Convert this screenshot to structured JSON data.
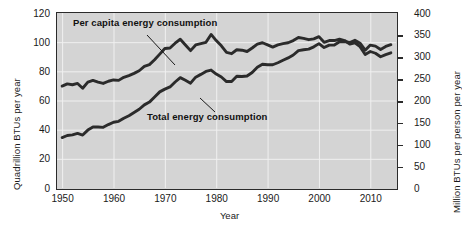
{
  "chart_data": {
    "type": "line",
    "title": "",
    "xlabel": "Year",
    "ylabel": "Quadrillion BTUs per year",
    "ylabel_right": "Million BTUs per person per year",
    "xlim": [
      1949,
      2015
    ],
    "ylim": [
      0,
      120
    ],
    "ylim_right": [
      0,
      400
    ],
    "xticks": [
      1950,
      1960,
      1970,
      1980,
      1990,
      2000,
      2010
    ],
    "xtick_labels": [
      "1950",
      "1960",
      "1970",
      "1980",
      "1990",
      "2000",
      "2010"
    ],
    "yticks_left": [
      0,
      20,
      40,
      60,
      80,
      100,
      120
    ],
    "ytick_labels_left": [
      "0",
      "20",
      "40",
      "60",
      "80",
      "100",
      "120"
    ],
    "yticks_right": [
      0,
      50,
      100,
      150,
      200,
      250,
      300,
      350,
      400
    ],
    "ytick_labels_right": [
      "0",
      "50",
      "100",
      "150",
      "200",
      "250",
      "300",
      "350",
      "400"
    ],
    "grid": true,
    "grid_color": "#f0f0f0",
    "plot_background": "#d4d4d4",
    "line_color": "#2b2b2b",
    "legend_position": "inline-annotations",
    "series": [
      {
        "name": "Per capita energy consumption",
        "axis": "right",
        "units": "Million BTUs per person per year",
        "x": [
          1950,
          1951,
          1952,
          1953,
          1954,
          1955,
          1956,
          1957,
          1958,
          1959,
          1960,
          1961,
          1962,
          1963,
          1964,
          1965,
          1966,
          1967,
          1968,
          1969,
          1970,
          1971,
          1972,
          1973,
          1974,
          1975,
          1976,
          1977,
          1978,
          1979,
          1980,
          1981,
          1982,
          1983,
          1984,
          1985,
          1986,
          1987,
          1988,
          1989,
          1990,
          1991,
          1992,
          1993,
          1994,
          1995,
          1996,
          1997,
          1998,
          1999,
          2000,
          2001,
          2002,
          2003,
          2004,
          2005,
          2006,
          2007,
          2008,
          2009,
          2010,
          2011,
          2012,
          2013,
          2014
        ],
        "values": [
          233,
          238,
          236,
          239,
          228,
          242,
          246,
          242,
          239,
          244,
          247,
          246,
          253,
          257,
          262,
          268,
          278,
          282,
          293,
          306,
          319,
          320,
          331,
          340,
          327,
          314,
          327,
          330,
          333,
          351,
          337,
          325,
          310,
          307,
          316,
          315,
          312,
          320,
          329,
          332,
          327,
          322,
          327,
          330,
          332,
          337,
          344,
          342,
          339,
          341,
          346,
          333,
          337,
          337,
          340,
          337,
          329,
          332,
          323,
          305,
          312,
          308,
          300,
          305,
          309
        ],
        "label_text": "Per capita energy consumption"
      },
      {
        "name": "Total energy consumption",
        "axis": "left",
        "units": "Quadrillion BTUs per year",
        "x": [
          1950,
          1951,
          1952,
          1953,
          1954,
          1955,
          1956,
          1957,
          1958,
          1959,
          1960,
          1961,
          1962,
          1963,
          1964,
          1965,
          1966,
          1967,
          1968,
          1969,
          1970,
          1971,
          1972,
          1973,
          1974,
          1975,
          1976,
          1977,
          1978,
          1979,
          1980,
          1981,
          1982,
          1983,
          1984,
          1985,
          1986,
          1987,
          1988,
          1989,
          1990,
          1991,
          1992,
          1993,
          1994,
          1995,
          1996,
          1997,
          1998,
          1999,
          2000,
          2001,
          2002,
          2003,
          2004,
          2005,
          2006,
          2007,
          2008,
          2009,
          2010,
          2011,
          2012,
          2013,
          2014
        ],
        "values": [
          34.6,
          36.0,
          36.4,
          37.4,
          36.3,
          39.7,
          41.8,
          41.8,
          41.6,
          43.5,
          45.1,
          45.7,
          47.8,
          49.6,
          51.8,
          54.0,
          57.0,
          58.9,
          62.4,
          65.9,
          67.8,
          69.3,
          72.7,
          75.7,
          73.9,
          71.9,
          76.0,
          77.9,
          79.9,
          80.9,
          78.1,
          76.1,
          73.0,
          73.0,
          76.6,
          76.5,
          76.8,
          79.2,
          82.8,
          84.9,
          84.5,
          84.5,
          85.9,
          87.6,
          89.2,
          91.2,
          94.2,
          94.8,
          95.2,
          96.8,
          99.0,
          96.3,
          98.0,
          98.1,
          100.3,
          100.4,
          99.8,
          101.3,
          99.3,
          94.5,
          98.0,
          97.3,
          95.0,
          97.1,
          98.3
        ],
        "label_text": "Total energy consumption"
      }
    ]
  },
  "annotations": {
    "per_capita_label": "Per capita energy consumption",
    "total_label": "Total energy consumption"
  }
}
